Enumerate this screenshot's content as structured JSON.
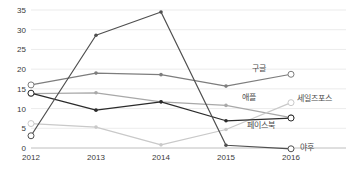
{
  "chart_data": {
    "type": "line",
    "title": "",
    "subtitle": "",
    "xlabel": "",
    "ylabel": "",
    "categories": [
      "2012",
      "2013",
      "2014",
      "2015",
      "2016"
    ],
    "x": [
      2012,
      2013,
      2014,
      2015,
      2016
    ],
    "ylim": [
      0,
      35
    ],
    "yticks": [
      0,
      5,
      10,
      15,
      20,
      25,
      30,
      35
    ],
    "grid": true,
    "legend_position": "inline-right-end-labels",
    "series": [
      {
        "name": "구글",
        "label": "구글",
        "color": "#7d7d7d",
        "values": [
          16.0,
          19.0,
          18.6,
          15.7,
          18.7
        ]
      },
      {
        "name": "애플",
        "label": "애플",
        "color": "#a8a8a8",
        "values": [
          13.8,
          14.0,
          11.7,
          10.8,
          7.7
        ]
      },
      {
        "name": "세일즈포스",
        "label": "세일즈포스",
        "color": "#c9c9c9",
        "values": [
          6.2,
          5.3,
          0.8,
          4.7,
          11.5
        ]
      },
      {
        "name": "페이스북",
        "label": "페이스북",
        "color": "#2b2b2b",
        "values": [
          13.9,
          9.6,
          11.7,
          6.9,
          7.6
        ]
      },
      {
        "name": "야후",
        "label": "야후",
        "color": "#4f4f4f",
        "values": [
          3.1,
          28.6,
          34.5,
          0.7,
          -0.2
        ]
      }
    ]
  },
  "axis": {
    "y_tick_labels": [
      "35",
      "30",
      "25",
      "20",
      "15",
      "10",
      "5",
      "0"
    ],
    "x_tick_labels": [
      "2012",
      "2013",
      "2014",
      "2015",
      "2016"
    ]
  },
  "series_labels": {
    "google": "구글",
    "apple": "애플",
    "salesforce": "세일즈포스",
    "facebook": "페이스북",
    "yahoo": "야후"
  }
}
